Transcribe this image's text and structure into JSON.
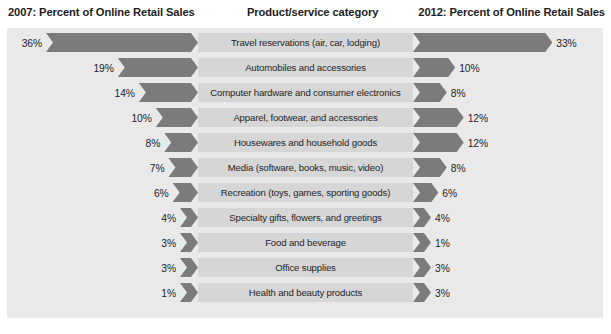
{
  "header": {
    "left_title": "2007: Percent of Online Retail Sales",
    "center_title": "Product/service category",
    "right_title": "2012: Percent of Online Retail Sales"
  },
  "colors": {
    "panel_background": "#e9e9e9",
    "bar_fill": "#7b7b7b",
    "center_band": "#d6d6d6",
    "text": "#1f1f26"
  },
  "chart_data": {
    "type": "bar",
    "xlabel": "",
    "ylabel": "",
    "orientation": "horizontal-diverging",
    "categories": [
      "Travel reservations (air, car, lodging)",
      "Automobiles and accessories",
      "Computer hardware and consumer electronics",
      "Apparel, footwear, and accessories",
      "Housewares and household goods",
      "Media (software, books, music, video)",
      "Recreation (toys, games, sporting goods)",
      "Specialty gifts, flowers, and greetings",
      "Food and beverage",
      "Office supplies",
      "Health and beauty products"
    ],
    "series": [
      {
        "name": "2007: Percent of Online Retail Sales",
        "side": "left",
        "values": [
          36,
          19,
          14,
          10,
          8,
          7,
          6,
          4,
          3,
          3,
          1
        ],
        "labels": [
          "36%",
          "19%",
          "14%",
          "10%",
          "8%",
          "7%",
          "6%",
          "4%",
          "3%",
          "3%",
          "1%"
        ]
      },
      {
        "name": "2012: Percent of Online Retail Sales",
        "side": "right",
        "values": [
          33,
          10,
          8,
          12,
          12,
          8,
          6,
          4,
          1,
          3,
          3
        ],
        "labels": [
          "33%",
          "10%",
          "8%",
          "12%",
          "12%",
          "8%",
          "6%",
          "4%",
          "1%",
          "3%",
          "3%"
        ]
      }
    ],
    "xlim": [
      0,
      36
    ],
    "grid": false,
    "legend": "none"
  },
  "rows": [
    {
      "category": "Travel reservations (air, car, lodging)",
      "left_pct": "36%",
      "right_pct": "33%",
      "left_value": 36,
      "right_value": 33
    },
    {
      "category": "Automobiles and accessories",
      "left_pct": "19%",
      "right_pct": "10%",
      "left_value": 19,
      "right_value": 10
    },
    {
      "category": "Computer hardware and consumer electronics",
      "left_pct": "14%",
      "right_pct": "8%",
      "left_value": 14,
      "right_value": 8
    },
    {
      "category": "Apparel, footwear, and accessories",
      "left_pct": "10%",
      "right_pct": "12%",
      "left_value": 10,
      "right_value": 12
    },
    {
      "category": "Housewares and household goods",
      "left_pct": "8%",
      "right_pct": "12%",
      "left_value": 8,
      "right_value": 12
    },
    {
      "category": "Media (software, books, music, video)",
      "left_pct": "7%",
      "right_pct": "8%",
      "left_value": 7,
      "right_value": 8
    },
    {
      "category": "Recreation (toys, games, sporting goods)",
      "left_pct": "6%",
      "right_pct": "6%",
      "left_value": 6,
      "right_value": 6
    },
    {
      "category": "Specialty gifts, flowers, and greetings",
      "left_pct": "4%",
      "right_pct": "4%",
      "left_value": 4,
      "right_value": 4
    },
    {
      "category": "Food and beverage",
      "left_pct": "3%",
      "right_pct": "1%",
      "left_value": 3,
      "right_value": 1
    },
    {
      "category": "Office supplies",
      "left_pct": "3%",
      "right_pct": "3%",
      "left_value": 3,
      "right_value": 3
    },
    {
      "category": "Health and beauty products",
      "left_pct": "1%",
      "right_pct": "3%",
      "left_value": 1,
      "right_value": 3
    }
  ]
}
